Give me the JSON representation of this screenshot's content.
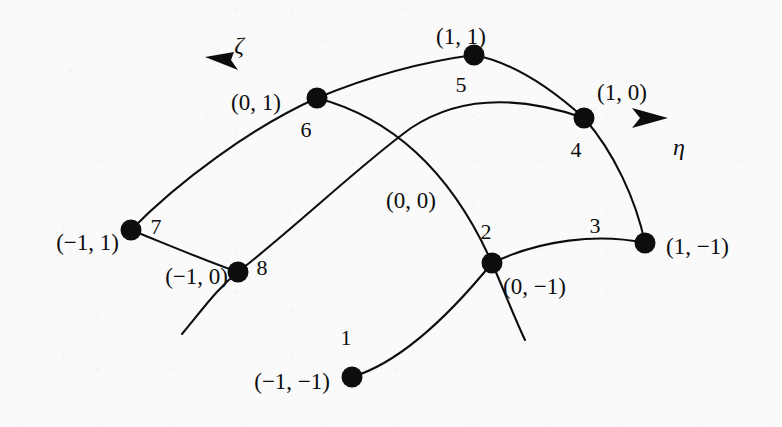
{
  "figure": {
    "background_color": "#fafafa",
    "ink_color": "#0d0d0d"
  },
  "axes": [
    {
      "name": "zeta-axis",
      "label": "ζ",
      "label_x": 239,
      "label_y": 45,
      "origin_x": 317,
      "origin_y": 98,
      "tip_x": 205,
      "tip_y": 57
    },
    {
      "name": "eta-axis",
      "label": "η",
      "label_x": 679,
      "label_y": 147,
      "origin_x": 584,
      "origin_y": 118,
      "tip_x": 668,
      "tip_y": 118
    }
  ],
  "origin_label": {
    "text": "(0, 0)",
    "x": 411,
    "y": 200
  },
  "nodes": [
    {
      "id": "1",
      "coord": "(−1, −1)",
      "cx": 352,
      "cy": 377,
      "num_x": 346,
      "num_y": 338,
      "coord_x": 330,
      "coord_y": 381,
      "coord_anchor": "r"
    },
    {
      "id": "2",
      "coord": "(0, −1)",
      "cx": 492,
      "cy": 263,
      "num_x": 486,
      "num_y": 232,
      "coord_x": 503,
      "coord_y": 286,
      "coord_anchor": "l"
    },
    {
      "id": "3",
      "coord": "(1, −1)",
      "cx": 645,
      "cy": 243,
      "num_x": 595,
      "num_y": 226,
      "coord_x": 666,
      "coord_y": 246,
      "coord_anchor": "l"
    },
    {
      "id": "4",
      "coord": "(1, 0)",
      "cx": 584,
      "cy": 118,
      "num_x": 576,
      "num_y": 150,
      "coord_x": 622,
      "coord_y": 92,
      "coord_anchor": "c"
    },
    {
      "id": "5",
      "coord": "(1, 1)",
      "cx": 474,
      "cy": 55,
      "num_x": 461,
      "num_y": 85,
      "coord_x": 461,
      "coord_y": 36,
      "coord_anchor": "c"
    },
    {
      "id": "6",
      "coord": "(0, 1)",
      "cx": 317,
      "cy": 98,
      "num_x": 306,
      "num_y": 130,
      "coord_x": 256,
      "coord_y": 102,
      "coord_anchor": "c"
    },
    {
      "id": "7",
      "coord": "(−1, 1)",
      "cx": 131,
      "cy": 230,
      "num_x": 156,
      "num_y": 227,
      "coord_x": 119,
      "coord_y": 242,
      "coord_anchor": "r"
    },
    {
      "id": "8",
      "coord": "(−1, 0)",
      "cx": 238,
      "cy": 272,
      "num_x": 262,
      "num_y": 268,
      "coord_x": 228,
      "coord_y": 276,
      "coord_anchor": "r"
    }
  ],
  "edges": [
    {
      "name": "edge-1-2-3-bottom",
      "d": "M 352 377 C 402 362 452 312 492 263 C 540 240 598 233 645 243"
    },
    {
      "name": "edge-3-4-right",
      "d": "M 645 243 C 636 200 614 152 584 118"
    },
    {
      "name": "edge-4-5-6-top",
      "d": "M 584 118 C 553 90 516 63 474 55 C 420 62 363 79 317 98"
    },
    {
      "name": "edge-6-7-left",
      "d": "M 317 98 C 252 127 178 182 131 230"
    },
    {
      "name": "edge-7-8-inner",
      "d": "M 131 230 C 166 244 206 261 238 272"
    },
    {
      "name": "axis-eta-curve",
      "d": "M 182 334 C 206 305 218 288 238 272 C 298 225 360 165 411 128 C 468 90 532 100 584 118"
    },
    {
      "name": "axis-zeta-curve",
      "d": "M 525 340 C 512 312 503 288 492 263 C 455 180 400 120 317 98"
    }
  ],
  "arrowheads": [
    {
      "name": "zeta-arrowhead",
      "points": "205,57 238,70 231,60 234,52"
    },
    {
      "name": "eta-arrowhead",
      "points": "668,118 632,128 640,118 632,108"
    }
  ]
}
